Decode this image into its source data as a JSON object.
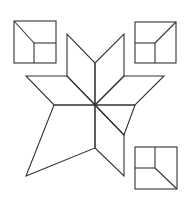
{
  "figure": {
    "title": "Quilt block star pattern with three corner squares",
    "background": "#ffffff",
    "stroke_color": "#333333",
    "stroke_width": 1.1,
    "star": {
      "center": [
        95,
        105
      ],
      "pieces": [
        {
          "name": "diamond-upper-left",
          "points": [
            [
              95,
              105
            ],
            [
              95,
              63
            ],
            [
              67,
              34
            ],
            [
              67,
              76
            ]
          ]
        },
        {
          "name": "diamond-upper-right",
          "points": [
            [
              95,
              105
            ],
            [
              95,
              63
            ],
            [
              124,
              34
            ],
            [
              124,
              76
            ]
          ]
        },
        {
          "name": "diamond-left",
          "points": [
            [
              95,
              105
            ],
            [
              67,
              76
            ],
            [
              26,
              76
            ],
            [
              54,
              105
            ]
          ]
        },
        {
          "name": "diamond-right",
          "points": [
            [
              95,
              105
            ],
            [
              124,
              76
            ],
            [
              164,
              76
            ],
            [
              135,
              105
            ]
          ]
        },
        {
          "name": "diamond-lower-right",
          "points": [
            [
              95,
              105
            ],
            [
              124,
              135
            ],
            [
              124,
              176
            ],
            [
              95,
              148
            ]
          ]
        },
        {
          "name": "diamond-lower-right-2",
          "points": [
            [
              95,
              105
            ],
            [
              135,
              105
            ],
            [
              124,
              135
            ]
          ]
        },
        {
          "name": "kite-lower-left",
          "points": [
            [
              95,
              105
            ],
            [
              54,
              105
            ],
            [
              26,
              176
            ],
            [
              95,
              148
            ]
          ]
        }
      ]
    },
    "squares": [
      {
        "name": "square-top-left",
        "x": 14,
        "y": 21,
        "size": 42,
        "inner": {
          "vx": 34,
          "hy": 43,
          "diag": [
            [
              14,
              21
            ],
            [
              34,
              43
            ]
          ]
        }
      },
      {
        "name": "square-top-right",
        "x": 135,
        "y": 22,
        "size": 41,
        "inner": {
          "vx": 155,
          "hy": 43,
          "diag": [
            [
              176,
              22
            ],
            [
              155,
              43
            ]
          ]
        }
      },
      {
        "name": "square-bottom-right",
        "x": 135,
        "y": 147,
        "size": 42,
        "inner": {
          "vx": 155,
          "hy": 168,
          "diag": [
            [
              155,
              168
            ],
            [
              177,
              189
            ]
          ]
        }
      }
    ]
  }
}
